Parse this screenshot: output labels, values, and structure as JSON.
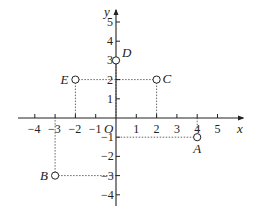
{
  "diagram": {
    "type": "coordinate-plane",
    "origin_label": "O",
    "x_axis": {
      "name": "x",
      "min": -4,
      "max": 5,
      "tick_labels": [
        "-4",
        "-3",
        "-2",
        "-1",
        "1",
        "2",
        "3",
        "4",
        "5"
      ]
    },
    "y_axis": {
      "name": "y",
      "min": -4,
      "max": 5,
      "tick_labels": [
        "-4",
        "-3",
        "-2",
        "-1",
        "1",
        "2",
        "3",
        "4",
        "5"
      ]
    },
    "points": [
      {
        "label": "A",
        "x": 4,
        "y": -1
      },
      {
        "label": "B",
        "x": -3,
        "y": -3
      },
      {
        "label": "C",
        "x": 2,
        "y": 2
      },
      {
        "label": "D",
        "x": 0,
        "y": 3
      },
      {
        "label": "E",
        "x": -2,
        "y": 2
      }
    ],
    "colors": {
      "axis": "#222222",
      "dotted": "#555555",
      "point_fill": "#ffffff"
    }
  }
}
